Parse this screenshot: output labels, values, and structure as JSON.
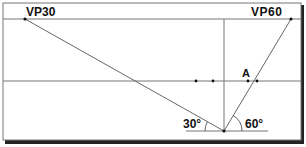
{
  "diagram": {
    "type": "two-point perspective construction",
    "vanishing_points": [
      {
        "label": "VP30",
        "angle_deg": 30
      },
      {
        "label": "VP60",
        "angle_deg": 60
      }
    ],
    "point_labels": [
      {
        "label": "A"
      }
    ],
    "angles": [
      {
        "label": "30°",
        "value": 30
      },
      {
        "label": "60°",
        "value": 60
      }
    ]
  }
}
